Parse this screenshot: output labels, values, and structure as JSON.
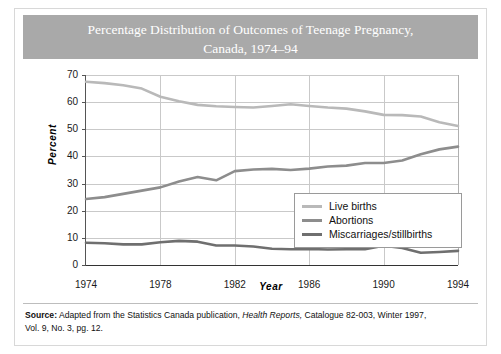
{
  "title": {
    "line1": "Percentage Distribution of Outcomes of Teenage Pregnancy,",
    "line2": "Canada, 1974–94"
  },
  "colors": {
    "title_bar": "#a9a9a9",
    "title_text": "#ffffff",
    "live_births": "#b9b9b9",
    "abortions": "#8d8d8d",
    "miscarriages": "#6f6f6f",
    "gridline": "#c9c9c9",
    "axis": "#333333"
  },
  "legend": {
    "position": "center-right-inside",
    "items": [
      {
        "label": "Live births",
        "color": "#b9b9b9"
      },
      {
        "label": "Abortions",
        "color": "#8d8d8d"
      },
      {
        "label": "Miscarriages/stillbirths",
        "color": "#6f6f6f"
      }
    ]
  },
  "source": {
    "label": "Source:",
    "text_1": " Adapted from the Statistics Canada publication, ",
    "italic": "Health Reports,",
    "text_2": " Catalogue 82-003, Winter 1997,",
    "line2": "Vol. 9, No. 3, pg. 12."
  },
  "chart_data": {
    "type": "line",
    "title": "Percentage Distribution of Outcomes of Teenage Pregnancy, Canada, 1974–94",
    "xlabel": "Year",
    "ylabel": "Percent",
    "xlim": [
      1974,
      1994
    ],
    "ylim": [
      0,
      70
    ],
    "ytick_values": [
      0,
      10,
      20,
      30,
      40,
      50,
      60,
      70
    ],
    "xtick_values": [
      1974,
      1978,
      1982,
      1986,
      1990,
      1994
    ],
    "grid": "horizontal-and-major-vertical",
    "x": [
      1974,
      1975,
      1976,
      1977,
      1978,
      1979,
      1980,
      1981,
      1982,
      1983,
      1984,
      1985,
      1986,
      1987,
      1988,
      1989,
      1990,
      1991,
      1992,
      1993,
      1994
    ],
    "series": [
      {
        "name": "Live births",
        "color": "#b9b9b9",
        "values": [
          67.5,
          67.0,
          66.2,
          65.0,
          62.0,
          60.3,
          59.0,
          58.5,
          58.2,
          58.0,
          58.6,
          59.2,
          58.6,
          58.0,
          57.6,
          56.6,
          55.3,
          55.2,
          54.7,
          52.6,
          51.2
        ]
      },
      {
        "name": "Abortions",
        "color": "#8d8d8d",
        "values": [
          24.3,
          25.0,
          26.2,
          27.4,
          28.6,
          30.8,
          32.4,
          31.2,
          34.6,
          35.2,
          35.4,
          35.0,
          35.5,
          36.3,
          36.6,
          37.6,
          37.6,
          38.5,
          40.8,
          42.6,
          43.6
        ]
      },
      {
        "name": "Miscarriages/stillbirths",
        "color": "#6f6f6f",
        "values": [
          8.2,
          8.0,
          7.6,
          7.6,
          8.4,
          8.9,
          8.6,
          7.2,
          7.2,
          6.8,
          6.0,
          5.8,
          5.9,
          5.7,
          5.8,
          5.8,
          7.1,
          6.3,
          4.5,
          4.8,
          5.2
        ]
      }
    ]
  }
}
